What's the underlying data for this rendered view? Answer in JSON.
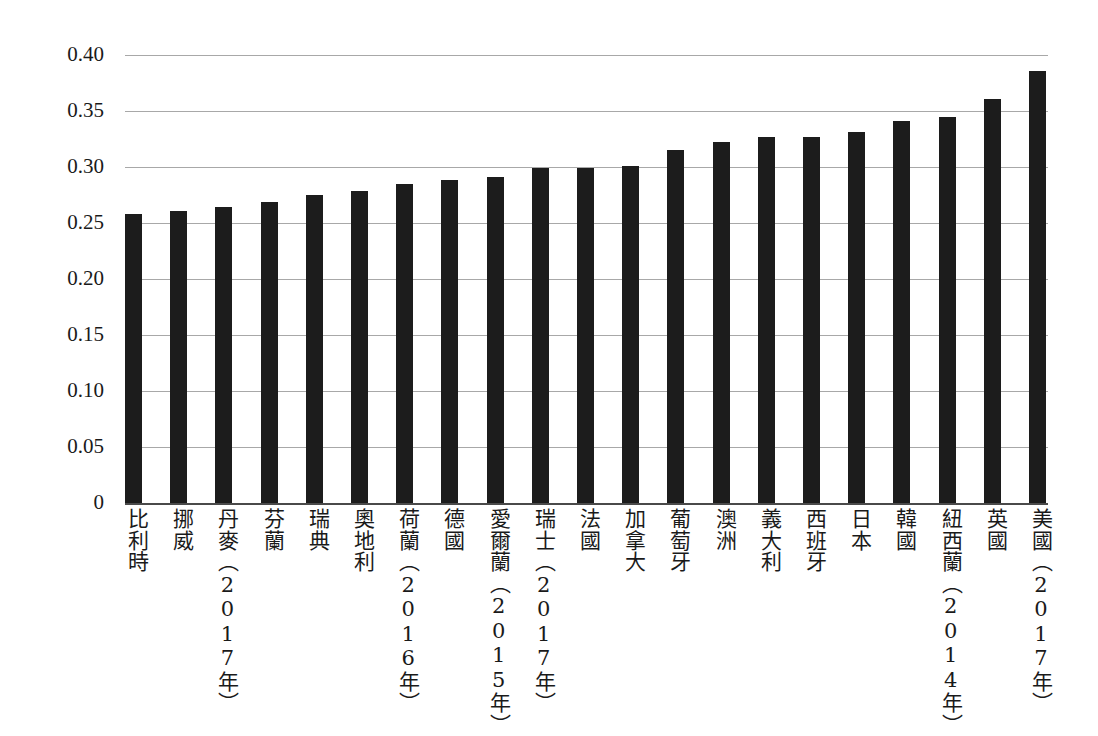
{
  "chart_data": {
    "type": "bar",
    "title": "",
    "subtitle": "",
    "xlabel": "",
    "ylabel": "",
    "ylim": [
      0,
      0.4
    ],
    "ytick_labels": [
      "0.40",
      "0.35",
      "0.30",
      "0.25",
      "0.20",
      "0.15",
      "0.10",
      "0.05",
      "0"
    ],
    "ytick_values": [
      0.4,
      0.35,
      0.3,
      0.25,
      0.2,
      0.15,
      0.1,
      0.05,
      0
    ],
    "grid": true,
    "legend": "none",
    "orientation": "vertical",
    "bar_color": "#1c1c1c",
    "gridline_color": "#a8a8a8",
    "axis_color": "#4a4a4a",
    "categories": [
      "比利時",
      "挪威",
      "丹麥（2017年）",
      "芬蘭",
      "瑞典",
      "奧地利",
      "荷蘭（2016年）",
      "德國",
      "愛爾蘭（2015年）",
      "瑞士（2017年）",
      "法國",
      "加拿大",
      "葡萄牙",
      "澳洲",
      "義大利",
      "西班牙",
      "日本",
      "韓國",
      "紐西蘭（2014年）",
      "英國",
      "美國（2017年）"
    ],
    "values": [
      0.258,
      0.261,
      0.264,
      0.269,
      0.275,
      0.279,
      0.285,
      0.288,
      0.291,
      0.299,
      0.299,
      0.301,
      0.315,
      0.322,
      0.327,
      0.327,
      0.331,
      0.341,
      0.345,
      0.361,
      0.386
    ]
  }
}
